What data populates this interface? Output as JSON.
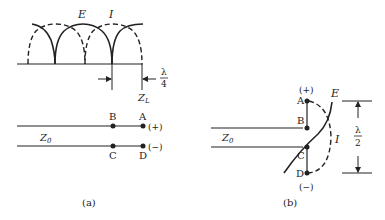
{
  "figure_a": {
    "caption": "(a)",
    "wave_labels": {
      "voltage": "E",
      "current": "I"
    },
    "load_label": "Z",
    "load_sub": "L",
    "lambda_num": "λ",
    "lambda_den": "4",
    "line_label": "Z",
    "line_sub": "0",
    "points": {
      "A": "A",
      "B": "B",
      "C": "C",
      "D": "D"
    },
    "polarity_top": "(+)",
    "polarity_bottom": "(−)"
  },
  "figure_b": {
    "caption": "(b)",
    "wave_labels": {
      "voltage": "E",
      "current": "I"
    },
    "line_label": "Z",
    "line_sub": "0",
    "lambda_num": "λ",
    "lambda_den": "2",
    "points": {
      "A": "A",
      "B": "B",
      "C": "C",
      "D": "D"
    },
    "polarity_top": "(+)",
    "polarity_bottom": "(−)"
  }
}
